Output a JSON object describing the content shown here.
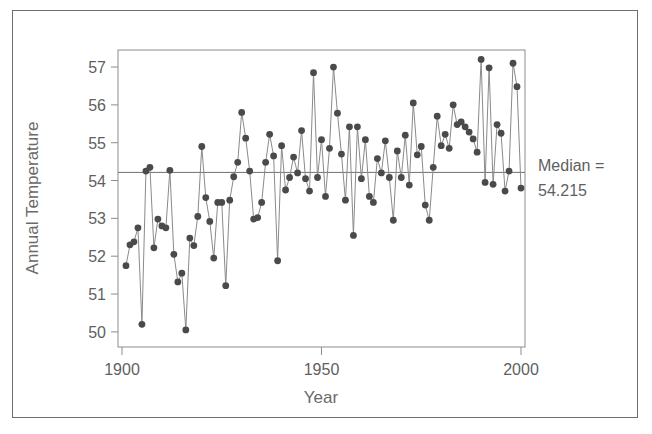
{
  "figure": {
    "frame_color": "#6e6e6e",
    "background": "#ffffff"
  },
  "annotation": {
    "median_label": "Median =",
    "median_value": "54.215"
  },
  "chart_data": {
    "type": "line",
    "title": "",
    "subtitle": "",
    "xlabel": "Year",
    "ylabel": "Annual Temperature",
    "xlim": [
      1899,
      2001
    ],
    "ylim": [
      49.6,
      57.45
    ],
    "xticks": [
      1900,
      1950,
      2000
    ],
    "xticklabels": [
      "1900",
      "1950",
      "2000"
    ],
    "yticks": [
      50,
      51,
      52,
      53,
      54,
      55,
      56,
      57
    ],
    "yticklabels": [
      "50",
      "51",
      "52",
      "53",
      "54",
      "55",
      "56",
      "57"
    ],
    "grid": false,
    "legend": null,
    "marker": "circle",
    "marker_color": "#4a4a4a",
    "line_color": "#8a8a8a",
    "reference_lines": [
      {
        "name": "median",
        "orientation": "horizontal",
        "value": 54.215,
        "color": "#6f6f6f"
      }
    ],
    "series": [
      {
        "name": "Annual Temperature",
        "x": [
          1901,
          1902,
          1903,
          1904,
          1905,
          1906,
          1907,
          1908,
          1909,
          1910,
          1911,
          1912,
          1913,
          1914,
          1915,
          1916,
          1917,
          1918,
          1919,
          1920,
          1921,
          1922,
          1923,
          1924,
          1925,
          1926,
          1927,
          1928,
          1929,
          1930,
          1931,
          1932,
          1933,
          1934,
          1935,
          1936,
          1937,
          1938,
          1939,
          1940,
          1941,
          1942,
          1943,
          1944,
          1945,
          1946,
          1947,
          1948,
          1949,
          1950,
          1951,
          1952,
          1953,
          1954,
          1955,
          1956,
          1957,
          1958,
          1959,
          1960,
          1961,
          1962,
          1963,
          1964,
          1965,
          1966,
          1967,
          1968,
          1969,
          1970,
          1971,
          1972,
          1973,
          1974,
          1975,
          1976,
          1977,
          1978,
          1979,
          1980,
          1981,
          1982,
          1983,
          1984,
          1985,
          1986,
          1987,
          1988,
          1989,
          1990,
          1991,
          1992,
          1993,
          1994,
          1995,
          1996,
          1997,
          1998,
          1999,
          2000
        ],
        "values": [
          51.75,
          52.3,
          52.38,
          52.75,
          50.2,
          54.25,
          54.35,
          52.22,
          52.98,
          52.8,
          52.75,
          54.27,
          52.05,
          51.32,
          51.55,
          50.05,
          52.48,
          52.28,
          53.05,
          54.9,
          53.55,
          52.92,
          51.95,
          53.42,
          53.42,
          51.22,
          53.48,
          54.1,
          54.48,
          55.8,
          55.12,
          54.25,
          52.98,
          53.02,
          53.42,
          54.48,
          55.22,
          54.65,
          51.88,
          54.92,
          53.75,
          54.08,
          54.62,
          54.2,
          55.32,
          54.05,
          53.72,
          56.85,
          54.08,
          55.08,
          53.58,
          54.85,
          57.0,
          55.78,
          54.7,
          53.48,
          55.42,
          52.55,
          55.42,
          54.05,
          55.08,
          53.58,
          53.42,
          54.58,
          54.2,
          55.05,
          54.08,
          52.95,
          54.78,
          54.08,
          55.2,
          53.88,
          56.05,
          54.68,
          54.9,
          53.35,
          52.95,
          54.35,
          55.7,
          54.92,
          55.22,
          54.85,
          56.0,
          55.48,
          55.55,
          55.42,
          55.28,
          55.1,
          54.75,
          57.2,
          53.95,
          56.98,
          53.9,
          55.48,
          55.25,
          53.72,
          54.25,
          57.1,
          56.48,
          53.8
        ]
      }
    ]
  }
}
